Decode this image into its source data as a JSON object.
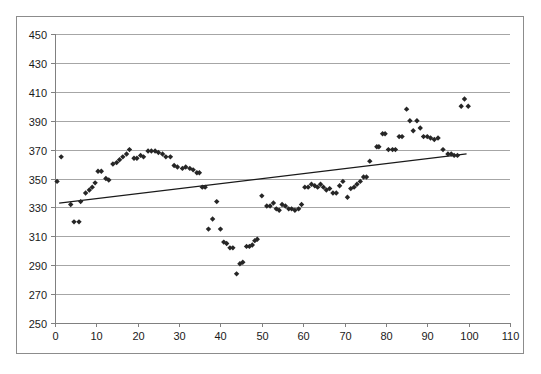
{
  "caption": {
    "text": "",
    "note": "faint cut-off text above chart, illegible"
  },
  "chart": {
    "title": "",
    "subtitle": "",
    "frame_border_color": "#8c8c8c",
    "grid_color": "#a6a6a6",
    "marker_color": "#262626",
    "trendline_color": "#1a1a1a",
    "background": "#ffffff"
  },
  "axes": {
    "y_ticks": [
      "450",
      "430",
      "410",
      "390",
      "370",
      "350",
      "330",
      "310",
      "290",
      "270",
      "250"
    ],
    "x_ticks": [
      "0",
      "10",
      "20",
      "30",
      "40",
      "50",
      "60",
      "70",
      "80",
      "90",
      "100",
      "110"
    ],
    "y_label": "",
    "x_label": ""
  },
  "chart_data": {
    "type": "scatter",
    "title": "",
    "xlabel": "",
    "ylabel": "",
    "xlim": [
      0,
      110
    ],
    "ylim": [
      250,
      450
    ],
    "x_tick_step": 10,
    "y_tick_step": 20,
    "grid": "horizontal",
    "legend": "none",
    "marker_shape": "diamond",
    "marker_color": "#262626",
    "series": [
      {
        "name": "observations",
        "points": [
          [
            0.5,
            348
          ],
          [
            1.5,
            365
          ],
          [
            3.8,
            332
          ],
          [
            4.6,
            320
          ],
          [
            5.8,
            320
          ],
          [
            6.2,
            334
          ],
          [
            7.4,
            340
          ],
          [
            8.3,
            342
          ],
          [
            9.0,
            344
          ],
          [
            9.7,
            347
          ],
          [
            10.4,
            355
          ],
          [
            11.2,
            355
          ],
          [
            12.3,
            350
          ],
          [
            13.0,
            349
          ],
          [
            14.0,
            360
          ],
          [
            14.9,
            361
          ],
          [
            15.6,
            363
          ],
          [
            16.4,
            365
          ],
          [
            17.3,
            367
          ],
          [
            18.0,
            370
          ],
          [
            19.1,
            364
          ],
          [
            19.8,
            364
          ],
          [
            20.7,
            366
          ],
          [
            21.4,
            365
          ],
          [
            22.5,
            369
          ],
          [
            23.3,
            369
          ],
          [
            24.2,
            369
          ],
          [
            25.0,
            368
          ],
          [
            26.0,
            367
          ],
          [
            26.8,
            365
          ],
          [
            27.9,
            365
          ],
          [
            28.8,
            359
          ],
          [
            29.6,
            358
          ],
          [
            30.8,
            357
          ],
          [
            31.6,
            358
          ],
          [
            32.6,
            357
          ],
          [
            33.4,
            356
          ],
          [
            34.3,
            354
          ],
          [
            34.9,
            354
          ],
          [
            35.6,
            344
          ],
          [
            36.3,
            344
          ],
          [
            37.1,
            315
          ],
          [
            38.1,
            322
          ],
          [
            39.1,
            334
          ],
          [
            40.0,
            315
          ],
          [
            40.8,
            306
          ],
          [
            41.5,
            305
          ],
          [
            42.3,
            302
          ],
          [
            43.0,
            302
          ],
          [
            43.9,
            284
          ],
          [
            44.7,
            291
          ],
          [
            45.4,
            292
          ],
          [
            46.3,
            303
          ],
          [
            47.0,
            303
          ],
          [
            47.7,
            304
          ],
          [
            48.3,
            307
          ],
          [
            48.9,
            308
          ],
          [
            50.0,
            338
          ],
          [
            51.2,
            331
          ],
          [
            52.0,
            331
          ],
          [
            52.8,
            333
          ],
          [
            53.5,
            329
          ],
          [
            54.2,
            328
          ],
          [
            54.9,
            332
          ],
          [
            55.7,
            331
          ],
          [
            56.5,
            329
          ],
          [
            57.2,
            329
          ],
          [
            58.0,
            328
          ],
          [
            58.9,
            329
          ],
          [
            59.6,
            332
          ],
          [
            60.4,
            344
          ],
          [
            61.2,
            344
          ],
          [
            62.0,
            346
          ],
          [
            62.8,
            345
          ],
          [
            63.5,
            344
          ],
          [
            64.2,
            346
          ],
          [
            64.9,
            344
          ],
          [
            65.6,
            342
          ],
          [
            66.4,
            343
          ],
          [
            67.2,
            340
          ],
          [
            68.0,
            340
          ],
          [
            68.8,
            345
          ],
          [
            69.6,
            348
          ],
          [
            70.7,
            337
          ],
          [
            71.5,
            343
          ],
          [
            72.3,
            344
          ],
          [
            73.0,
            346
          ],
          [
            73.8,
            348
          ],
          [
            74.6,
            351
          ],
          [
            75.3,
            351
          ],
          [
            76.1,
            362
          ],
          [
            77.8,
            372
          ],
          [
            78.3,
            372
          ],
          [
            79.2,
            381
          ],
          [
            79.8,
            381
          ],
          [
            80.6,
            370
          ],
          [
            81.6,
            370
          ],
          [
            82.3,
            370
          ],
          [
            83.2,
            379
          ],
          [
            83.9,
            379
          ],
          [
            85.0,
            398
          ],
          [
            85.8,
            390
          ],
          [
            86.6,
            383
          ],
          [
            87.5,
            390
          ],
          [
            88.3,
            385
          ],
          [
            89.1,
            379
          ],
          [
            90.0,
            379
          ],
          [
            90.8,
            378
          ],
          [
            91.7,
            377
          ],
          [
            92.6,
            378
          ],
          [
            93.8,
            370
          ],
          [
            95.0,
            367
          ],
          [
            95.8,
            367
          ],
          [
            96.5,
            366
          ],
          [
            97.3,
            366
          ],
          [
            98.2,
            400
          ],
          [
            99.0,
            405
          ],
          [
            99.9,
            400
          ]
        ]
      }
    ],
    "trendline": {
      "type": "linear",
      "x_start": 1.0,
      "y_start": 333,
      "x_end": 99.5,
      "y_end": 367,
      "approx_slope": 0.345,
      "approx_intercept": 332.7
    }
  }
}
